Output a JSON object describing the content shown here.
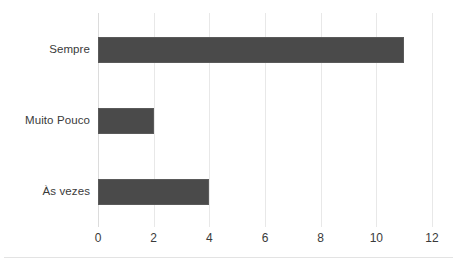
{
  "chart_data": {
    "type": "bar",
    "orientation": "horizontal",
    "title": "",
    "subtitle": "",
    "xlabel": "",
    "ylabel": "",
    "categories": [
      "Sempre",
      "Muito Pouco",
      "Às vezes"
    ],
    "values": [
      11,
      2,
      4
    ],
    "series": [
      {
        "name": "",
        "values": [
          11,
          2,
          4
        ]
      }
    ],
    "xlim": [
      0,
      12
    ],
    "xticks": [
      0,
      2,
      4,
      6,
      8,
      10,
      12
    ],
    "xtick_labels": [
      "0",
      "2",
      "4",
      "6",
      "8",
      "10",
      "12"
    ],
    "grid": "vertical",
    "legend": "none",
    "annotations": [],
    "colors": {
      "bar_fill": "#4a4a4a",
      "bar_border": "#5a5a5a",
      "gridline": "#e8e8e8",
      "axis_line": "#dcdcdc",
      "text": "#3a3a3a",
      "background": "#ffffff",
      "bottom_rule": "#e3e3e3"
    }
  }
}
